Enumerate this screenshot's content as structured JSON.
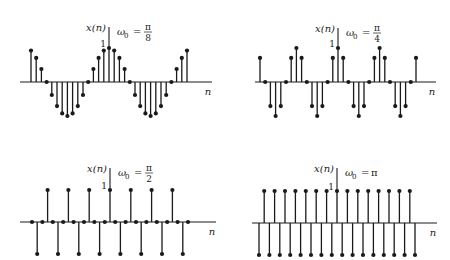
{
  "figure": {
    "ink_color": "#1a1a1a",
    "background": "#ffffff"
  },
  "chart_data": [
    {
      "type": "stem",
      "title": "ω0 = π/8",
      "ylabel": "x(n)",
      "xlabel": "n",
      "ytick_label": "1",
      "omega_label": "ω",
      "omega_sub": "0",
      "omega_num": "π",
      "omega_den": "8",
      "n_range": [
        -15,
        15
      ],
      "formula": "cos(pi*n/8)",
      "x": [
        -15,
        -14,
        -13,
        -12,
        -11,
        -10,
        -9,
        -8,
        -7,
        -6,
        -5,
        -4,
        -3,
        -2,
        -1,
        0,
        1,
        2,
        3,
        4,
        5,
        6,
        7,
        8,
        9,
        10,
        11,
        12,
        13,
        14,
        15
      ],
      "values": [
        0.924,
        0.707,
        0.383,
        0,
        -0.383,
        -0.707,
        -0.924,
        -1,
        -0.924,
        -0.707,
        -0.383,
        0,
        0.383,
        0.707,
        0.924,
        1,
        0.924,
        0.707,
        0.383,
        0,
        -0.383,
        -0.707,
        -0.924,
        -1,
        -0.924,
        -0.707,
        -0.383,
        0,
        0.383,
        0.707,
        0.924
      ],
      "layout": {
        "x0": 109,
        "y0": 82,
        "dx": 5.2,
        "amp": 34,
        "axis_left": 20,
        "axis_right": 212,
        "vaxis_top": 27
      }
    },
    {
      "type": "stem",
      "title": "ω0 = π/4",
      "ylabel": "x(n)",
      "xlabel": "n",
      "ytick_label": "1",
      "omega_label": "ω",
      "omega_sub": "0",
      "omega_num": "π",
      "omega_den": "4",
      "n_range": [
        -15,
        15
      ],
      "formula": "cos(pi*n/4)",
      "x": [
        -15,
        -14,
        -13,
        -12,
        -11,
        -10,
        -9,
        -8,
        -7,
        -6,
        -5,
        -4,
        -3,
        -2,
        -1,
        0,
        1,
        2,
        3,
        4,
        5,
        6,
        7,
        8,
        9,
        10,
        11,
        12,
        13,
        14,
        15
      ],
      "values": [
        0.707,
        0,
        -0.707,
        -1,
        -0.707,
        0,
        0.707,
        1,
        0.707,
        0,
        -0.707,
        -1,
        -0.707,
        0,
        0.707,
        1,
        0.707,
        0,
        -0.707,
        -1,
        -0.707,
        0,
        0.707,
        1,
        0.707,
        0,
        -0.707,
        -1,
        -0.707,
        0,
        0.707
      ],
      "layout": {
        "x0": 338,
        "y0": 82,
        "dx": 5.2,
        "amp": 34,
        "axis_left": 255,
        "axis_right": 436,
        "vaxis_top": 28
      }
    },
    {
      "type": "stem",
      "title": "ω0 = π/2",
      "ylabel": "x(n)",
      "xlabel": "n",
      "ytick_label": "1",
      "omega_label": "ω",
      "omega_sub": "0",
      "omega_num": "π",
      "omega_den": "2",
      "n_range": [
        -15,
        15
      ],
      "formula": "cos(pi*n/2)",
      "x": [
        -15,
        -14,
        -13,
        -12,
        -11,
        -10,
        -9,
        -8,
        -7,
        -6,
        -5,
        -4,
        -3,
        -2,
        -1,
        0,
        1,
        2,
        3,
        4,
        5,
        6,
        7,
        8,
        9,
        10,
        11,
        12,
        13,
        14,
        15
      ],
      "values": [
        0,
        -1,
        0,
        1,
        0,
        -1,
        0,
        1,
        0,
        -1,
        0,
        1,
        0,
        -1,
        0,
        1,
        0,
        -1,
        0,
        1,
        0,
        -1,
        0,
        1,
        0,
        -1,
        0,
        1,
        0,
        -1,
        0
      ],
      "layout": {
        "x0": 110,
        "y0": 222,
        "dx": 5.2,
        "amp": 32,
        "axis_left": 20,
        "axis_right": 216,
        "vaxis_top": 168
      }
    },
    {
      "type": "stem",
      "title": "ω0 = π",
      "ylabel": "x(n)",
      "xlabel": "n",
      "ytick_label": "1",
      "omega_label": "ω",
      "omega_sub": "0",
      "omega_num": "π",
      "omega_den": "",
      "n_range": [
        -15,
        15
      ],
      "formula": "cos(pi*n)",
      "x": [
        -15,
        -14,
        -13,
        -12,
        -11,
        -10,
        -9,
        -8,
        -7,
        -6,
        -5,
        -4,
        -3,
        -2,
        -1,
        0,
        1,
        2,
        3,
        4,
        5,
        6,
        7,
        8,
        9,
        10,
        11,
        12,
        13,
        14,
        15
      ],
      "values": [
        -1,
        1,
        -1,
        1,
        -1,
        1,
        -1,
        1,
        -1,
        1,
        -1,
        1,
        -1,
        1,
        -1,
        1,
        -1,
        1,
        -1,
        1,
        -1,
        1,
        -1,
        1,
        -1,
        1,
        -1,
        1,
        -1,
        1,
        -1
      ],
      "layout": {
        "x0": 337,
        "y0": 223,
        "dx": 5.2,
        "amp": 32,
        "axis_left": 252,
        "axis_right": 437,
        "vaxis_top": 168
      }
    }
  ]
}
